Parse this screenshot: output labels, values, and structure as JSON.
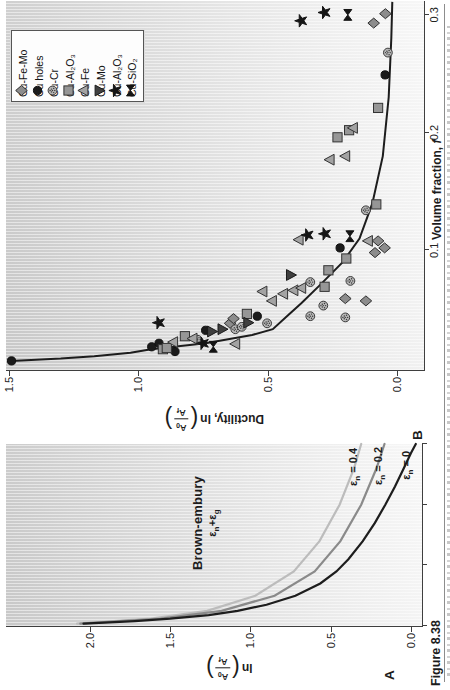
{
  "figure": {
    "label": "Figure 8.38",
    "panel_a_letter": "A",
    "panel_b_letter": "B"
  },
  "frac": {
    "num": "A",
    "num_sub": "0",
    "den": "A",
    "den_sub": "f"
  },
  "labels": {
    "ylabel_a_prefix": "ln",
    "ylabel_b_prefix": "Ductility, ln",
    "xlabel_b": "Volume fraction, ",
    "xlabel_b_var": "f"
  },
  "chart_data": [
    {
      "id": "brown_embury_model",
      "type": "line",
      "title": "Brown-embury",
      "subtitle_parts": {
        "p1": "ε",
        "s1": "n",
        "p2": "+ε",
        "s2": "g"
      },
      "ylabel": "ln(A0/Af)",
      "xlabel": "",
      "xlim": [
        0,
        0.3
      ],
      "ylim": [
        -0.0685,
        2.523
      ],
      "yticks": [
        {
          "v": 0.0,
          "label": "0.0"
        },
        {
          "v": 0.5,
          "label": "0.5"
        },
        {
          "v": 1.0,
          "label": "1.0"
        },
        {
          "v": 1.5,
          "label": "1.5"
        },
        {
          "v": 2.0,
          "label": "2.0"
        }
      ],
      "xticks": [
        0,
        0.1,
        0.2,
        0.3
      ],
      "grid": false,
      "series": [
        {
          "name_parts": {
            "sym": "ε",
            "sub": "n",
            "eq": " = 0.4"
          },
          "color": "#bcbcbc",
          "points": [
            [
              0.004,
              2.08
            ],
            [
              0.012,
              1.62
            ],
            [
              0.025,
              1.27
            ],
            [
              0.05,
              0.97
            ],
            [
              0.09,
              0.73
            ],
            [
              0.14,
              0.57
            ],
            [
              0.2,
              0.445
            ],
            [
              0.26,
              0.355
            ],
            [
              0.3,
              0.31
            ]
          ]
        },
        {
          "name_parts": {
            "sym": "ε",
            "sub": "n",
            "eq": " = 0.2"
          },
          "color": "#8a8a8a",
          "points": [
            [
              0.004,
              2.06
            ],
            [
              0.012,
              1.56
            ],
            [
              0.025,
              1.18
            ],
            [
              0.05,
              0.85
            ],
            [
              0.09,
              0.6
            ],
            [
              0.14,
              0.44
            ],
            [
              0.2,
              0.31
            ],
            [
              0.26,
              0.215
            ],
            [
              0.3,
              0.165
            ]
          ]
        },
        {
          "name_parts": {
            "sym": "ε",
            "sub": "n",
            "eq": " = 0"
          },
          "color": "#1d1d1d",
          "points": [
            [
              0.004,
              2.04
            ],
            [
              0.008,
              1.72
            ],
            [
              0.012,
              1.5
            ],
            [
              0.018,
              1.26
            ],
            [
              0.025,
              1.08
            ],
            [
              0.035,
              0.9
            ],
            [
              0.05,
              0.72
            ],
            [
              0.07,
              0.565
            ],
            [
              0.09,
              0.465
            ],
            [
              0.11,
              0.39
            ],
            [
              0.14,
              0.3
            ],
            [
              0.17,
              0.225
            ],
            [
              0.2,
              0.16
            ],
            [
              0.23,
              0.1
            ],
            [
              0.26,
              0.045
            ],
            [
              0.285,
              0.0
            ],
            [
              0.3,
              -0.03
            ]
          ]
        }
      ]
    },
    {
      "id": "ductility_vs_volume_fraction",
      "type": "scatter",
      "title": "",
      "ylabel": "Ductility, ln(A0/Af)",
      "xlabel": "Volume fraction, f",
      "xlim": [
        -0.0017,
        0.3118
      ],
      "ylim": [
        -0.1044,
        1.5114
      ],
      "yticks": [
        {
          "v": 0.0,
          "label": "0.0"
        },
        {
          "v": 0.5,
          "label": "0.5"
        },
        {
          "v": 1.0,
          "label": "1.0"
        },
        {
          "v": 1.5,
          "label": "1.5"
        }
      ],
      "xticks": [
        {
          "v": 0.1,
          "label": "0.1"
        },
        {
          "v": 0.2,
          "label": "0.2"
        },
        {
          "v": 0.3,
          "label": "0.3"
        }
      ],
      "grid": false,
      "legend_position": "upper right",
      "fit_curve": {
        "color": "#1d1d1d",
        "points": [
          [
            0.006,
            1.49
          ],
          [
            0.008,
            1.3
          ],
          [
            0.01,
            1.17
          ],
          [
            0.013,
            1.03
          ],
          [
            0.016,
            0.95
          ],
          [
            0.021,
            0.74
          ],
          [
            0.028,
            0.56
          ],
          [
            0.033,
            0.48
          ],
          [
            0.045,
            0.42
          ],
          [
            0.055,
            0.37
          ],
          [
            0.07,
            0.3
          ],
          [
            0.09,
            0.21
          ],
          [
            0.11,
            0.145
          ],
          [
            0.14,
            0.095
          ],
          [
            0.18,
            0.055
          ],
          [
            0.23,
            0.032
          ],
          [
            0.28,
            0.022
          ],
          [
            0.311,
            0.018
          ]
        ]
      },
      "series": [
        {
          "name": "Cu-Fe-Mo",
          "marker": "diamond",
          "fill": "#8c8c8c",
          "stroke": "#2e2e2e",
          "points": [
            [
              0.038,
              0.645
            ],
            [
              0.042,
              0.632
            ],
            [
              0.057,
              0.12
            ],
            [
              0.059,
              0.2
            ],
            [
              0.098,
              0.085
            ],
            [
              0.102,
              0.048
            ],
            [
              0.108,
              0.073
            ],
            [
              0.293,
              0.09
            ],
            [
              0.301,
              0.045
            ]
          ]
        },
        {
          "name": "Cu holes",
          "marker": "circle",
          "fill": "#1b1b1b",
          "stroke": "#111111",
          "points": [
            [
              0.006,
              1.49
            ],
            [
              0.014,
              0.858
            ],
            [
              0.018,
              0.948
            ],
            [
              0.021,
              0.92
            ],
            [
              0.032,
              0.74
            ],
            [
              0.044,
              0.54
            ],
            [
              0.102,
              0.22
            ],
            [
              0.249,
              0.046
            ]
          ]
        },
        {
          "name": "Cu-Cr",
          "marker": "circle-dot",
          "fill": "#b7b7b7",
          "stroke": "#3a3a3a",
          "points": [
            [
              0.024,
              0.77
            ],
            [
              0.033,
              0.625
            ],
            [
              0.035,
              0.6
            ],
            [
              0.038,
              0.502
            ],
            [
              0.043,
              0.2
            ],
            [
              0.044,
              0.335
            ],
            [
              0.053,
              0.285
            ],
            [
              0.073,
              0.335
            ],
            [
              0.074,
              0.18
            ],
            [
              0.134,
              0.12
            ],
            [
              0.268,
              0.035
            ]
          ]
        },
        {
          "name": "Cu-Al₂O₃",
          "marker": "square",
          "fill": "#969696",
          "stroke": "#333333",
          "points": [
            [
              0.016,
              0.905
            ],
            [
              0.017,
              0.89
            ],
            [
              0.027,
              0.82
            ],
            [
              0.046,
              0.58
            ],
            [
              0.069,
              0.28
            ],
            [
              0.083,
              0.265
            ],
            [
              0.093,
              0.196
            ],
            [
              0.139,
              0.08
            ],
            [
              0.196,
              0.23
            ],
            [
              0.202,
              0.185
            ],
            [
              0.221,
              0.073
            ]
          ]
        },
        {
          "name": "Cu-Fe",
          "marker": "triangle-up",
          "fill": "#a3a3a3",
          "stroke": "#333333",
          "points": [
            [
              0.0205,
              0.625
            ],
            [
              0.022,
              0.865
            ],
            [
              0.025,
              0.79
            ],
            [
              0.057,
              0.483
            ],
            [
              0.063,
              0.44
            ],
            [
              0.065,
              0.52
            ],
            [
              0.066,
              0.4
            ],
            [
              0.068,
              0.37
            ],
            [
              0.108,
              0.112
            ],
            [
              0.109,
              0.38
            ],
            [
              0.177,
              0.26
            ],
            [
              0.18,
              0.2
            ],
            [
              0.204,
              0.17
            ]
          ]
        },
        {
          "name": "Cu-Mo",
          "marker": "triangle-down",
          "fill": "#404040",
          "stroke": "#1a1a1a",
          "points": [
            [
              0.031,
              0.715
            ],
            [
              0.033,
              0.675
            ],
            [
              0.0385,
              0.575
            ],
            [
              0.079,
              0.41
            ]
          ]
        },
        {
          "name": "Cu-Al₂O₃",
          "marker": "star",
          "fill": "#151515",
          "stroke": "#151515",
          "points": [
            [
              0.021,
              0.75
            ],
            [
              0.0385,
              0.92
            ],
            [
              0.113,
              0.345
            ],
            [
              0.114,
              0.278
            ],
            [
              0.295,
              0.37
            ],
            [
              0.302,
              0.28
            ]
          ]
        },
        {
          "name": "Cu-SiO₂",
          "marker": "bowtie",
          "fill": "#151515",
          "stroke": "#151515",
          "points": [
            [
              0.018,
              0.71
            ],
            [
              0.112,
              0.182
            ],
            [
              0.3,
              0.19
            ]
          ]
        }
      ]
    }
  ]
}
